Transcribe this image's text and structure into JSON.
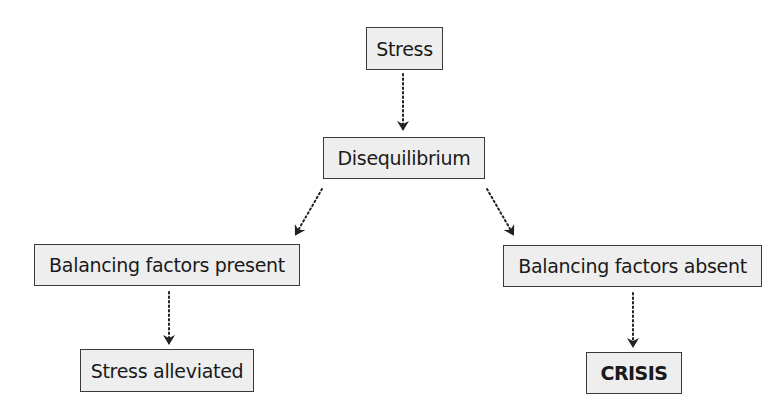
{
  "diagram": {
    "type": "flowchart",
    "nodes": [
      {
        "id": "stress",
        "label": "Stress",
        "bold": false
      },
      {
        "id": "disequilibrium",
        "label": "Disequilibrium",
        "bold": false
      },
      {
        "id": "balancing_present",
        "label": "Balancing factors present",
        "bold": false
      },
      {
        "id": "balancing_absent",
        "label": "Balancing factors absent",
        "bold": false
      },
      {
        "id": "stress_alleviated",
        "label": "Stress alleviated",
        "bold": false
      },
      {
        "id": "crisis",
        "label": "CRISIS",
        "bold": true
      }
    ],
    "edges": [
      {
        "from": "stress",
        "to": "disequilibrium",
        "style": "dotted-arrow"
      },
      {
        "from": "disequilibrium",
        "to": "balancing_present",
        "style": "dotted-arrow"
      },
      {
        "from": "disequilibrium",
        "to": "balancing_absent",
        "style": "dotted-arrow"
      },
      {
        "from": "balancing_present",
        "to": "stress_alleviated",
        "style": "dotted-arrow"
      },
      {
        "from": "balancing_absent",
        "to": "crisis",
        "style": "dotted-arrow"
      }
    ]
  },
  "colors": {
    "node_fill": "#eeeeee",
    "node_border": "#3a3a3a",
    "text": "#1a1a1a",
    "arrow": "#222222"
  }
}
